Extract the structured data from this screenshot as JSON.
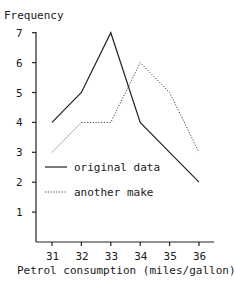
{
  "chart_data": {
    "type": "line",
    "title": "",
    "ylabel": "Frequency",
    "xlabel": "Petrol consumption (miles/gallon)",
    "x": [
      31,
      32,
      33,
      34,
      35,
      36
    ],
    "x_tick_labels": [
      "31",
      "32",
      "33",
      "34",
      "35",
      "36"
    ],
    "y_tick_labels": [
      "1",
      "2",
      "3",
      "4",
      "5",
      "6",
      "7"
    ],
    "ylim": [
      0,
      7
    ],
    "grid": false,
    "legend_position": "inside-lower-left",
    "series": [
      {
        "name": "original data",
        "style": "solid",
        "values": [
          4,
          5,
          7,
          4,
          3,
          2
        ]
      },
      {
        "name": "another make",
        "style": "dotted",
        "values": [
          3,
          4,
          4,
          6,
          5,
          3
        ]
      }
    ]
  },
  "colors": {
    "line": "#222222",
    "background": "#ffffff"
  }
}
